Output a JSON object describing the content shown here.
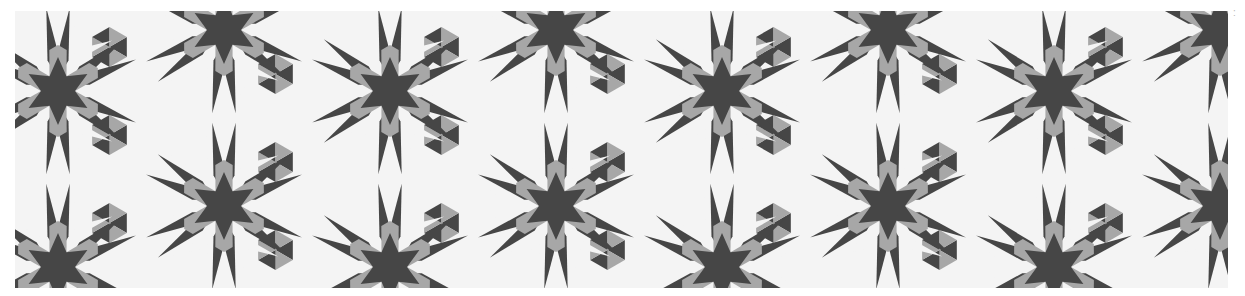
{
  "image": {
    "description": "Geometric tessellation of six-pointed stars with radiating arrow rays in dark gray, light gray and white",
    "frame": {
      "x": 15,
      "y": 11,
      "width": 1213,
      "height": 277
    },
    "colors": {
      "dark": "#464646",
      "gray": "#a7a7a7",
      "light": "#f4f4f4",
      "background": "#ffffff"
    },
    "lattice": {
      "column_spacing": 166,
      "row_spacing": 176,
      "first_column_x": 43,
      "row_a_first_y": 80,
      "row_b_first_y": 19,
      "columns": 9
    },
    "motif": {
      "star_inner_radius": 17,
      "star_outer_radius": 34,
      "kite_outer_radius": 42,
      "ray_length": 84,
      "ray_half_angle_deg": 11,
      "arrow_notch_radius": 50
    },
    "edge_mark": ":"
  }
}
